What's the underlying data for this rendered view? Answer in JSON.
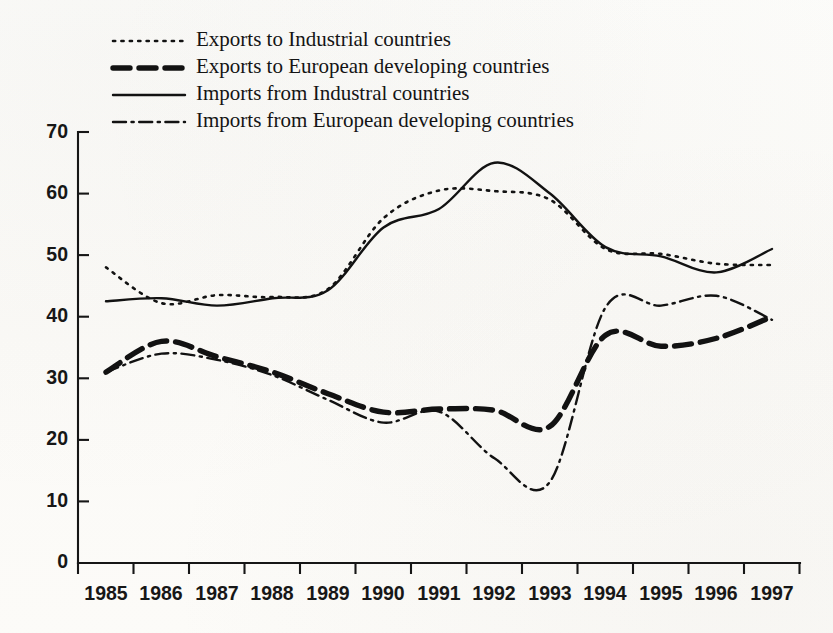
{
  "figure": {
    "title": "",
    "background_color": "#fdfdfb",
    "ink_color": "#121212"
  },
  "legend": {
    "position": "top-left-inside",
    "items": [
      {
        "label": "Exports to Industrial countries",
        "style": "dotted",
        "key": "exports_industrial"
      },
      {
        "label": "Exports to European developing countries",
        "style": "bold-dashed",
        "key": "exports_european_developing"
      },
      {
        "label": "Imports from Industral countries",
        "style": "solid",
        "key": "imports_industrial"
      },
      {
        "label": "Imports from European developing countries",
        "style": "dash-dot",
        "key": "imports_european_developing"
      }
    ]
  },
  "axes": {
    "y_ticks": [
      "70",
      "60",
      "50",
      "40",
      "30",
      "20",
      "10",
      "0"
    ],
    "x_ticks": [
      "1985",
      "1986",
      "1987",
      "1988",
      "1989",
      "1990",
      "1991",
      "1992",
      "1993",
      "1994",
      "1995",
      "1996",
      "1997"
    ],
    "ylim": [
      0,
      70
    ],
    "xlim": [
      "1985",
      "1997"
    ],
    "grid": false
  },
  "chart_data": {
    "type": "line",
    "title": "",
    "xlabel": "",
    "ylabel": "",
    "ylim": [
      0,
      70
    ],
    "grid": false,
    "legend_position": "top-left-inside",
    "x": [
      1985,
      1986,
      1987,
      1988,
      1989,
      1990,
      1991,
      1992,
      1993,
      1994,
      1995,
      1996,
      1997
    ],
    "categories": [
      "1985",
      "1986",
      "1987",
      "1988",
      "1989",
      "1990",
      "1991",
      "1992",
      "1993",
      "1994",
      "1995",
      "1996",
      "1997"
    ],
    "series": [
      {
        "name": "Exports to Industrial countries",
        "style": "dotted",
        "values": [
          48.0,
          42.2,
          43.5,
          43.2,
          44.5,
          56.0,
          60.5,
          60.4,
          59.0,
          51.0,
          50.2,
          48.6,
          48.4
        ]
      },
      {
        "name": "Exports to European developing countries",
        "style": "bold-dashed",
        "values": [
          31.0,
          36.0,
          33.5,
          31.0,
          27.5,
          24.5,
          25.0,
          24.8,
          22.2,
          37.0,
          35.2,
          36.5,
          40.0
        ]
      },
      {
        "name": "Imports from Industral countries",
        "style": "solid",
        "values": [
          42.5,
          43.0,
          41.8,
          43.0,
          44.3,
          54.5,
          57.5,
          65.0,
          60.0,
          51.3,
          49.8,
          47.2,
          51.0
        ]
      },
      {
        "name": "Imports from European developing countries",
        "style": "dash-dot",
        "values": [
          31.0,
          34.0,
          33.0,
          30.5,
          26.5,
          22.8,
          24.6,
          17.0,
          13.2,
          41.5,
          41.8,
          43.4,
          39.5
        ]
      }
    ],
    "annotations": [
      {
        "text": "Imports from Industral countries peak",
        "x": 1992,
        "y": 65.0
      },
      {
        "text": "Imports from European developing countries trough",
        "x": 1992.7,
        "y": 13.0
      }
    ]
  }
}
